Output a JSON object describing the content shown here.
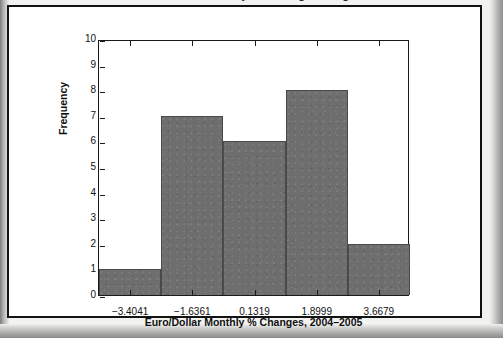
{
  "chart_data": {
    "type": "bar",
    "title": "Euro/Dollar Monthly Percentage Changes",
    "xlabel": "Euro/Dollar Monthly % Changes, 2004–2005",
    "ylabel": "Frequency",
    "categories": [
      "bin-1",
      "bin-2",
      "bin-3",
      "bin-4",
      "bin-5"
    ],
    "values": [
      1,
      7,
      6,
      8,
      2
    ],
    "bin_edges": [
      -4.2881,
      -2.5201,
      -0.7521,
      1.0159,
      2.7839,
      4.5519
    ],
    "x_tick_labels": [
      "−3.4041",
      "−1.6361",
      "0.1319",
      "1.8999",
      "3.6679"
    ],
    "x_tick_values": [
      -3.4041,
      -1.6361,
      0.1319,
      1.8999,
      3.6679
    ],
    "y_tick_labels": [
      "0",
      "1",
      "2",
      "3",
      "4",
      "5",
      "6",
      "7",
      "8",
      "9",
      "10"
    ],
    "ylim": [
      0,
      10
    ],
    "xlim": [
      -4.2881,
      4.5519
    ],
    "grid": false,
    "legend": "none",
    "bar_color": "#6e6e6e",
    "axis_color": "#1a1a1a",
    "frame_color": "#121212"
  }
}
